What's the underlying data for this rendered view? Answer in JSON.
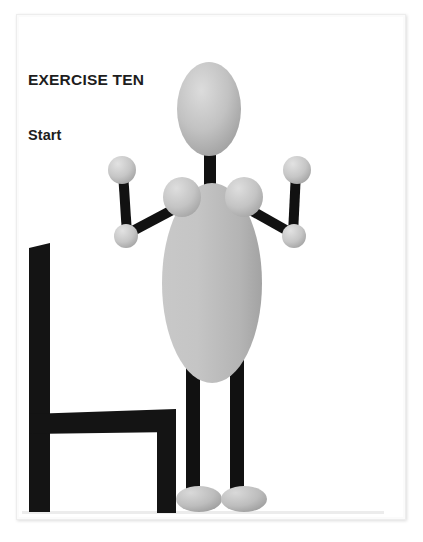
{
  "page": {
    "background_color": "#ffffff",
    "sheet_color": "#ffffff",
    "sheet_border_color": "#ededed"
  },
  "caption": {
    "title": "EXERCISE TEN",
    "subtitle": "Start",
    "text_color": "#1d1d1d"
  },
  "illustration": {
    "name": "stick-figure-standing-in-front-of-chair",
    "description": "Grey mannequin figure standing upright with arms bent at elbows, in front of a black silhouette chair",
    "colors": {
      "limb_black": "#111111",
      "body_grey_light": "#d2d2d2",
      "body_grey": "#b9b9b9",
      "body_grey_dark": "#9a9a9a",
      "chair_black": "#141414",
      "floor_line": "#e4e4e4"
    },
    "parts": [
      {
        "name": "chair",
        "label": "Chair"
      },
      {
        "name": "head",
        "label": "Head"
      },
      {
        "name": "neck",
        "label": "Neck"
      },
      {
        "name": "torso",
        "label": "Torso"
      },
      {
        "name": "shoulder-left",
        "label": "Left shoulder"
      },
      {
        "name": "shoulder-right",
        "label": "Right shoulder"
      },
      {
        "name": "arm-left",
        "label": "Left arm"
      },
      {
        "name": "arm-right",
        "label": "Right arm"
      },
      {
        "name": "leg-left",
        "label": "Left leg"
      },
      {
        "name": "leg-right",
        "label": "Right leg"
      },
      {
        "name": "foot-left",
        "label": "Left foot"
      },
      {
        "name": "foot-right",
        "label": "Right foot"
      }
    ]
  }
}
